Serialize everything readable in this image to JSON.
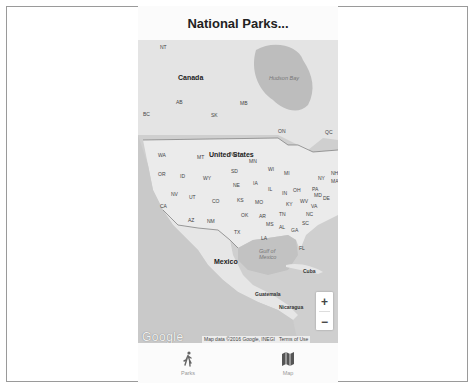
{
  "header": {
    "title": "National Parks..."
  },
  "map": {
    "countries": [
      {
        "label": "Canada",
        "x": 40,
        "y": 34
      },
      {
        "label": "United States",
        "x": 71,
        "y": 111
      },
      {
        "label": "Mexico",
        "x": 76,
        "y": 218
      }
    ],
    "regions": [
      {
        "label": "NT",
        "x": 22,
        "y": 4
      },
      {
        "label": "AB",
        "x": 38,
        "y": 59
      },
      {
        "label": "BC",
        "x": 5,
        "y": 71
      },
      {
        "label": "SK",
        "x": 73,
        "y": 72
      },
      {
        "label": "MB",
        "x": 102,
        "y": 60
      },
      {
        "label": "ON",
        "x": 140,
        "y": 88
      },
      {
        "label": "QC",
        "x": 187,
        "y": 89
      },
      {
        "label": "WA",
        "x": 20,
        "y": 112
      },
      {
        "label": "MT",
        "x": 59,
        "y": 114
      },
      {
        "label": "ND",
        "x": 92,
        "y": 111
      },
      {
        "label": "MN",
        "x": 111,
        "y": 118
      },
      {
        "label": "OR",
        "x": 20,
        "y": 131
      },
      {
        "label": "ID",
        "x": 42,
        "y": 133
      },
      {
        "label": "WY",
        "x": 65,
        "y": 135
      },
      {
        "label": "SD",
        "x": 93,
        "y": 128
      },
      {
        "label": "WI",
        "x": 130,
        "y": 126
      },
      {
        "label": "MI",
        "x": 146,
        "y": 130
      },
      {
        "label": "NY",
        "x": 180,
        "y": 135
      },
      {
        "label": "NE",
        "x": 95,
        "y": 142
      },
      {
        "label": "IA",
        "x": 115,
        "y": 140
      },
      {
        "label": "NV",
        "x": 33,
        "y": 151
      },
      {
        "label": "UT",
        "x": 51,
        "y": 154
      },
      {
        "label": "CO",
        "x": 74,
        "y": 158
      },
      {
        "label": "KS",
        "x": 99,
        "y": 157
      },
      {
        "label": "IL",
        "x": 130,
        "y": 146
      },
      {
        "label": "IN",
        "x": 144,
        "y": 150
      },
      {
        "label": "OH",
        "x": 155,
        "y": 147
      },
      {
        "label": "PA",
        "x": 174,
        "y": 146
      },
      {
        "label": "MO",
        "x": 117,
        "y": 159
      },
      {
        "label": "KY",
        "x": 148,
        "y": 161
      },
      {
        "label": "WV",
        "x": 162,
        "y": 158
      },
      {
        "label": "VA",
        "x": 173,
        "y": 163
      },
      {
        "label": "MD",
        "x": 176,
        "y": 152
      },
      {
        "label": "DE",
        "x": 185,
        "y": 155
      },
      {
        "label": "CA",
        "x": 22,
        "y": 163
      },
      {
        "label": "OK",
        "x": 103,
        "y": 172
      },
      {
        "label": "AR",
        "x": 121,
        "y": 173
      },
      {
        "label": "TN",
        "x": 141,
        "y": 171
      },
      {
        "label": "NC",
        "x": 168,
        "y": 171
      },
      {
        "label": "AZ",
        "x": 50,
        "y": 177
      },
      {
        "label": "NM",
        "x": 69,
        "y": 178
      },
      {
        "label": "SC",
        "x": 164,
        "y": 180
      },
      {
        "label": "MS",
        "x": 128,
        "y": 181
      },
      {
        "label": "AL",
        "x": 141,
        "y": 184
      },
      {
        "label": "GA",
        "x": 153,
        "y": 187
      },
      {
        "label": "TX",
        "x": 96,
        "y": 189
      },
      {
        "label": "LA",
        "x": 123,
        "y": 195
      },
      {
        "label": "FL",
        "x": 161,
        "y": 205
      },
      {
        "label": "NH",
        "x": 193,
        "y": 130
      },
      {
        "label": "MA",
        "x": 193,
        "y": 138
      }
    ],
    "places": [
      {
        "label": "Cuba",
        "x": 165,
        "y": 228
      },
      {
        "label": "Guatemala",
        "x": 117,
        "y": 251
      },
      {
        "label": "Nicaragua",
        "x": 141,
        "y": 264
      }
    ],
    "water": [
      {
        "label": "Hudson Bay",
        "x": 131,
        "y": 35
      },
      {
        "label": "Gulf of",
        "x": 121,
        "y": 208
      },
      {
        "label": "Mexico",
        "x": 121,
        "y": 214
      }
    ],
    "zoom_in": "+",
    "zoom_out": "−",
    "logo": "Google",
    "attribution": "Map data ©2016 Google, INEGI",
    "terms": "Terms of Use"
  },
  "tabs": [
    {
      "label": "Parks",
      "icon": "walking-person-icon"
    },
    {
      "label": "Map",
      "icon": "map-icon"
    }
  ]
}
